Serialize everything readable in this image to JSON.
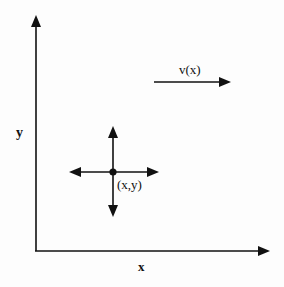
{
  "diagram": {
    "axes": {
      "x_label": "x",
      "y_label": "y"
    },
    "point": {
      "label": "(x,y)"
    },
    "velocity": {
      "label": "v(x)"
    },
    "colors": {
      "ink": "#111111",
      "background": "#fdfdfd"
    }
  }
}
